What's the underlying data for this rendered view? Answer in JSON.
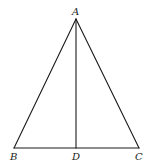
{
  "diagram": {
    "type": "geometry",
    "title": "",
    "stroke_color": "#1a1a1a",
    "background": "#ffffff",
    "points": {
      "A": {
        "label": "A",
        "x": 76,
        "y": 19
      },
      "B": {
        "label": "B",
        "x": 14,
        "y": 148
      },
      "C": {
        "label": "C",
        "x": 139,
        "y": 148
      },
      "D": {
        "label": "D",
        "x": 76,
        "y": 148
      }
    },
    "segments": [
      {
        "from": "A",
        "to": "B"
      },
      {
        "from": "A",
        "to": "C"
      },
      {
        "from": "B",
        "to": "C"
      },
      {
        "from": "A",
        "to": "D"
      }
    ],
    "labels": {
      "A": "A",
      "B": "B",
      "C": "C",
      "D": "D"
    }
  }
}
